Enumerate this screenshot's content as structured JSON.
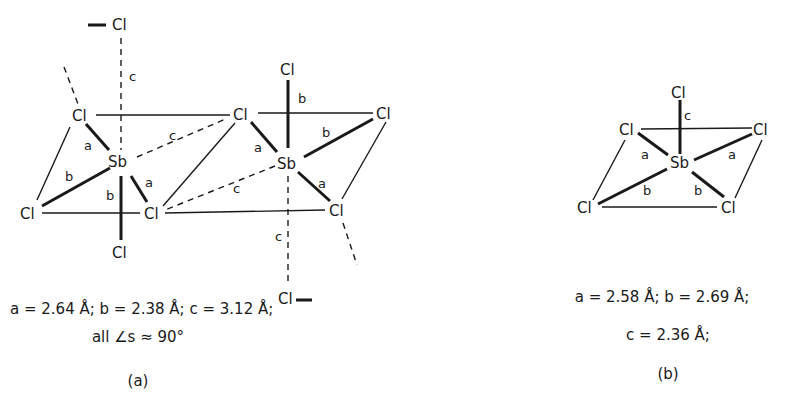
{
  "figure": {
    "panel_a": {
      "atoms": {
        "cl_top": "Cl",
        "cl_top_left": "Cl",
        "sb_left": "Sb",
        "cl_bottom_left": "Cl",
        "cl_bottom_center": "Cl",
        "cl_bottom": "Cl",
        "cl_shared_top": "Cl",
        "cl_right_top": "Cl",
        "sb_right": "Sb",
        "cl_right_upper_right": "Cl",
        "cl_right_lower_right": "Cl",
        "cl_right_bottom": "Cl"
      },
      "bond_labels": {
        "c_top": "c",
        "a_left_top": "a",
        "b_left_bl": "b",
        "b_left_down": "b",
        "a_left_bc": "a",
        "c_left_diag": "c",
        "b_right_top": "b",
        "a_right_tl": "a",
        "b_right_tr": "b",
        "a_right_br": "a",
        "c_right_diag": "c",
        "c_right_bottom": "c"
      },
      "params_line": "a = 2.64 Å; b = 2.38 Å; c = 3.12 Å;",
      "angles_line": "all ∠s ≈ 90°",
      "label": "(a)"
    },
    "panel_b": {
      "atoms": {
        "cl_top": "Cl",
        "cl_left": "Cl",
        "cl_right": "Cl",
        "sb": "Sb",
        "cl_bottom_left": "Cl",
        "cl_bottom_right": "Cl"
      },
      "bond_labels": {
        "c_top": "c",
        "a_left": "a",
        "a_right": "a",
        "b_left": "b",
        "b_right": "b"
      },
      "params_line1": "a = 2.58 Å; b = 2.69 Å;",
      "params_line2": "c = 2.36 Å;",
      "label": "(b)"
    },
    "bond_values": {
      "panel_a": {
        "a": 2.64,
        "b": 2.38,
        "c": 3.12,
        "unit": "Å",
        "angles": "≈ 90°"
      },
      "panel_b": {
        "a": 2.58,
        "b": 2.69,
        "c": 2.36,
        "unit": "Å"
      }
    }
  }
}
